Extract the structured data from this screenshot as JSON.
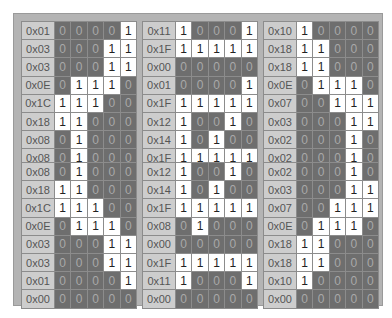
{
  "colors": {
    "frame": "#b4b4b4",
    "label_bg": "#cdcdcd",
    "bit_on": "#ffffff",
    "bit_off": "#6e6e6e"
  },
  "panels": [
    {
      "id": "p1",
      "rows": [
        {
          "hex": "0x01",
          "bits": "00001"
        },
        {
          "hex": "0x03",
          "bits": "00011"
        },
        {
          "hex": "0x03",
          "bits": "00011"
        },
        {
          "hex": "0x0E",
          "bits": "01110"
        },
        {
          "hex": "0x1C",
          "bits": "11100"
        },
        {
          "hex": "0x18",
          "bits": "11000"
        },
        {
          "hex": "0x08",
          "bits": "01000"
        },
        {
          "hex": "0x08",
          "bits": "01000"
        }
      ]
    },
    {
      "id": "p2",
      "rows": [
        {
          "hex": "0x11",
          "bits": "10001"
        },
        {
          "hex": "0x1F",
          "bits": "11111"
        },
        {
          "hex": "0x00",
          "bits": "00000"
        },
        {
          "hex": "0x01",
          "bits": "00001"
        },
        {
          "hex": "0x1F",
          "bits": "11111"
        },
        {
          "hex": "0x12",
          "bits": "10010"
        },
        {
          "hex": "0x14",
          "bits": "10100"
        },
        {
          "hex": "0x1F",
          "bits": "11111"
        }
      ]
    },
    {
      "id": "p3",
      "rows": [
        {
          "hex": "0x10",
          "bits": "10000"
        },
        {
          "hex": "0x18",
          "bits": "11000"
        },
        {
          "hex": "0x18",
          "bits": "11000"
        },
        {
          "hex": "0x0E",
          "bits": "01110"
        },
        {
          "hex": "0x07",
          "bits": "00111"
        },
        {
          "hex": "0x03",
          "bits": "00011"
        },
        {
          "hex": "0x02",
          "bits": "00010"
        },
        {
          "hex": "0x02",
          "bits": "00010"
        }
      ]
    },
    {
      "id": "p4",
      "rows": [
        {
          "hex": "0x08",
          "bits": "01000"
        },
        {
          "hex": "0x18",
          "bits": "11000"
        },
        {
          "hex": "0x1C",
          "bits": "11100"
        },
        {
          "hex": "0x0E",
          "bits": "01110"
        },
        {
          "hex": "0x03",
          "bits": "00011"
        },
        {
          "hex": "0x03",
          "bits": "00011"
        },
        {
          "hex": "0x01",
          "bits": "00001"
        },
        {
          "hex": "0x00",
          "bits": "00000"
        }
      ]
    },
    {
      "id": "p5",
      "rows": [
        {
          "hex": "0x12",
          "bits": "10010"
        },
        {
          "hex": "0x14",
          "bits": "10100"
        },
        {
          "hex": "0x1F",
          "bits": "11111"
        },
        {
          "hex": "0x08",
          "bits": "01000"
        },
        {
          "hex": "0x00",
          "bits": "00000"
        },
        {
          "hex": "0x1F",
          "bits": "11111"
        },
        {
          "hex": "0x11",
          "bits": "10001"
        },
        {
          "hex": "0x00",
          "bits": "00000"
        }
      ]
    },
    {
      "id": "p6",
      "rows": [
        {
          "hex": "0x02",
          "bits": "00010"
        },
        {
          "hex": "0x03",
          "bits": "00011"
        },
        {
          "hex": "0x07",
          "bits": "00111"
        },
        {
          "hex": "0x0E",
          "bits": "01110"
        },
        {
          "hex": "0x18",
          "bits": "11000"
        },
        {
          "hex": "0x18",
          "bits": "11000"
        },
        {
          "hex": "0x10",
          "bits": "10000"
        },
        {
          "hex": "0x00",
          "bits": "00000"
        }
      ]
    }
  ]
}
